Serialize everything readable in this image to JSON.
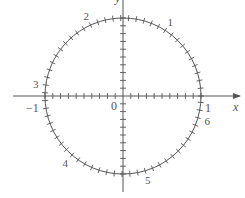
{
  "diagram": {
    "center": [
      123,
      96
    ],
    "radius": 78,
    "stroke_color": "#555555",
    "label_color": "#777777",
    "axes": {
      "x_label": "x",
      "y_label": "y",
      "x_tick_step": 0.1,
      "y_tick_step": 0.1
    },
    "axis_labels": {
      "origin": "0",
      "neg_one": "−1",
      "pos_one": "1"
    },
    "circle_tick_step_rad": 0.1,
    "radian_labels": [
      {
        "text": "1",
        "angle": 1
      },
      {
        "text": "2",
        "angle": 2
      },
      {
        "text": "3",
        "angle": 3
      },
      {
        "text": "4",
        "angle": 4
      },
      {
        "text": "5",
        "angle": 5
      },
      {
        "text": "6",
        "angle": 6
      }
    ]
  }
}
